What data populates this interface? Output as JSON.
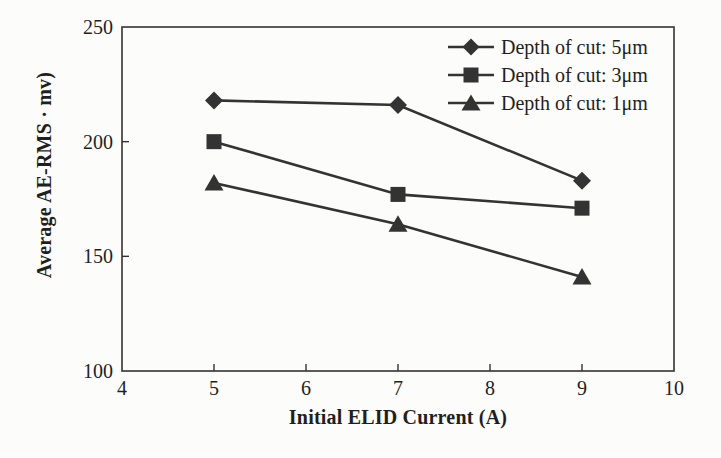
{
  "figure": {
    "background": "#fcfcfa",
    "ink": "#333333",
    "text_color": "#1f1f1f"
  },
  "chart_data": {
    "type": "line",
    "title": "",
    "xlabel": "Initial ELID Current (A)",
    "ylabel": "Average AE-RMS · mv)",
    "x": [
      5,
      7,
      9
    ],
    "series": [
      {
        "label": "Depth of cut: 5μm",
        "marker": "diamond",
        "values": [
          218,
          216,
          183
        ]
      },
      {
        "label": "Depth of cut: 3μm",
        "marker": "square",
        "values": [
          200,
          177,
          171
        ]
      },
      {
        "label": "Depth of cut: 1μm",
        "marker": "triangle",
        "values": [
          182,
          164,
          141
        ]
      }
    ],
    "xlim": [
      4,
      10
    ],
    "ylim": [
      100,
      250
    ],
    "xticks": [
      4,
      5,
      6,
      7,
      8,
      9,
      10
    ],
    "yticks": [
      100,
      150,
      200,
      250
    ],
    "grid": false,
    "legend_position": "top-right",
    "line_color": "#333333"
  }
}
